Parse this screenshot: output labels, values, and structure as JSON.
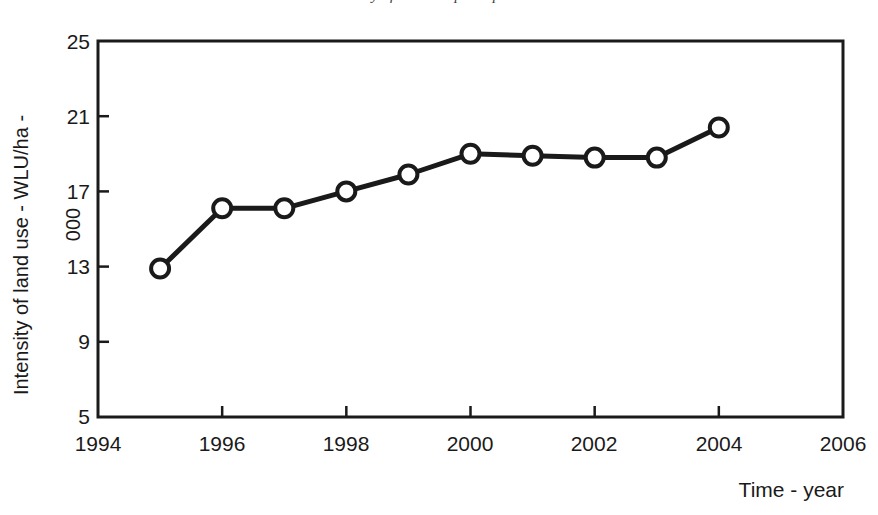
{
  "chart_data": {
    "type": "line",
    "title": "Intensity of land use per exploitation",
    "xlabel": "Time - year",
    "ylabel": "Intensity of land use - WLU/ha -",
    "ylabel_line2": "000",
    "x": [
      1995,
      1996,
      1997,
      1998,
      1999,
      2000,
      2001,
      2002,
      2003,
      2004
    ],
    "values": [
      12.9,
      16.1,
      16.1,
      17.0,
      17.9,
      19.0,
      18.9,
      18.8,
      18.8,
      20.4
    ],
    "series": [
      {
        "name": "Intensity of land use",
        "values": [
          12.9,
          16.1,
          16.1,
          17.0,
          17.9,
          19.0,
          18.9,
          18.8,
          18.8,
          20.4
        ]
      }
    ],
    "xlim": [
      1994,
      2006
    ],
    "ylim": [
      5,
      25
    ],
    "xticks": [
      "1994",
      "1996",
      "1998",
      "2000",
      "2002",
      "2004",
      "2006"
    ],
    "xtick_values": [
      1994,
      1996,
      1998,
      2000,
      2002,
      2004,
      2006
    ],
    "yticks": [
      "5",
      "9",
      "13",
      "17",
      "21",
      "25"
    ],
    "ytick_values": [
      5,
      9,
      13,
      17,
      21,
      25
    ],
    "grid": false,
    "legend": null,
    "line_color": "#1a1a1a",
    "marker": "open-circle",
    "marker_fill": "#ffffff",
    "plot_background": "#ffffff"
  }
}
